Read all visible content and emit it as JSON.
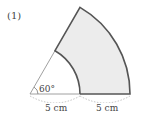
{
  "problem_number": "(1)",
  "angle_label": "60°",
  "inner_length_label": "5 cm",
  "outer_length_label": "5 cm",
  "colors": {
    "fill": "#ececec",
    "stroke": "#555555",
    "thin": "#888888"
  }
}
